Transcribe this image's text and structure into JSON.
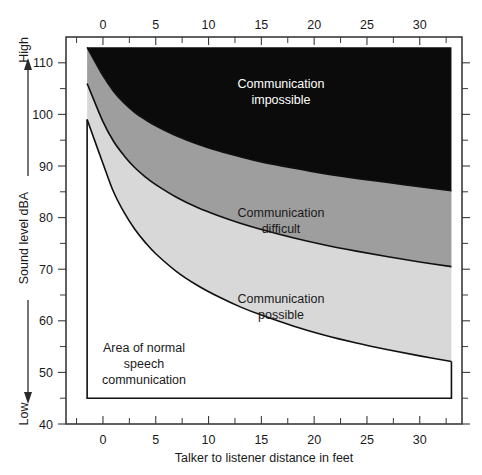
{
  "chart_data": {
    "type": "area",
    "title": "",
    "xlabel": "Talker to listener distance in feet",
    "ylabel": "Sound level dBA",
    "xlim": [
      -3.5,
      34
    ],
    "ylim": [
      40,
      115
    ],
    "grid": false,
    "legend_position": "none",
    "x_ticks_major": [
      0,
      5,
      10,
      15,
      20,
      25,
      30
    ],
    "x_tick_labels": [
      "0",
      "5",
      "10",
      "15",
      "20",
      "25",
      "30"
    ],
    "x_ticks_minor": [
      -2.5,
      2.5,
      7.5,
      12.5,
      17.5,
      22.5,
      27.5,
      32.5
    ],
    "y_ticks_major": [
      40,
      50,
      60,
      70,
      80,
      90,
      100,
      110
    ],
    "y_tick_labels": [
      "40",
      "50",
      "60",
      "70",
      "80",
      "90",
      "100",
      "110"
    ],
    "y_ticks_minor": [
      45,
      55,
      65,
      75,
      85,
      95,
      105
    ],
    "y_axis_high_label": "High",
    "y_axis_low_label": "Low",
    "x_axis_label_position": "bottom",
    "x_tick_label_positions": [
      "top",
      "bottom"
    ],
    "data_x_start": -1.5,
    "data_x_end": 33,
    "data_y_floor": 45,
    "data_y_ceiling": 113,
    "series": [
      {
        "name": "Communication impossible lower boundary",
        "description": "Upper boundary of Communication difficult band; above this line communication is impossible",
        "x": [
          -1.5,
          0,
          1,
          2,
          3,
          4,
          5,
          7,
          9,
          11,
          13,
          15,
          18,
          21,
          24,
          27,
          30,
          33
        ],
        "y": [
          113,
          107.5,
          104.5,
          102.2,
          100.4,
          99.0,
          97.8,
          95.8,
          94.2,
          92.9,
          91.8,
          90.8,
          89.6,
          88.5,
          87.6,
          86.8,
          86.0,
          85.2
        ]
      },
      {
        "name": "Communication difficult lower boundary",
        "description": "Upper boundary of Communication possible band",
        "x": [
          -1.5,
          0,
          1,
          2,
          3,
          4,
          5,
          7,
          9,
          11,
          13,
          15,
          18,
          21,
          24,
          27,
          30,
          33
        ],
        "y": [
          106.0,
          98.6,
          94.8,
          92.0,
          89.7,
          87.9,
          86.4,
          83.9,
          81.9,
          80.3,
          78.9,
          77.7,
          76.1,
          74.7,
          73.5,
          72.4,
          71.4,
          70.5
        ]
      },
      {
        "name": "Communication possible lower boundary",
        "description": "Upper boundary of Area of normal speech communication",
        "x": [
          -1.5,
          0,
          1,
          2,
          3,
          4,
          5,
          7,
          9,
          11,
          13,
          15,
          18,
          21,
          24,
          27,
          30,
          33
        ],
        "y": [
          99.0,
          90.5,
          85.0,
          81.0,
          77.8,
          75.2,
          73.0,
          69.5,
          66.8,
          64.6,
          62.7,
          61.1,
          59.0,
          57.2,
          55.7,
          54.4,
          53.2,
          52.1
        ]
      }
    ],
    "bands": [
      {
        "name": "communication-impossible",
        "label": "Communication impossible",
        "color": "#0b0b0b",
        "text_color": "#ffffff",
        "label_x": 20,
        "label_y": 103
      },
      {
        "name": "communication-difficult",
        "label": "Communication difficult",
        "color": "#9e9e9e",
        "text_color": "#1a1a1a",
        "label_x": 17.5,
        "label_y": 80.5
      },
      {
        "name": "communication-possible",
        "label": "Communication possible",
        "color": "#d8d8d8",
        "text_color": "#1a1a1a",
        "label_x": 17.5,
        "label_y": 63.5
      },
      {
        "name": "area-of-normal-speech-communication",
        "label": "Area of normal speech communication",
        "color": "#ffffff",
        "text_color": "#1a1a1a",
        "label_x": 4.5,
        "label_y": 51.5
      }
    ]
  },
  "labels": {
    "impossible_line1": "Communication",
    "impossible_line2": "impossible",
    "difficult_line1": "Communication",
    "difficult_line2": "difficult",
    "possible_line1": "Communication",
    "possible_line2": "possible",
    "normal_line1": "Area of normal",
    "normal_line2": "speech",
    "normal_line3": "communication"
  },
  "axes": {
    "x_title": "Talker to listener distance in feet",
    "y_title": "Sound level dBA",
    "y_high": "High",
    "y_low": "Low",
    "x_labels_top": [
      "0",
      "5",
      "10",
      "15",
      "20",
      "25",
      "30"
    ],
    "x_labels_bottom": [
      "0",
      "5",
      "10",
      "15",
      "20",
      "25",
      "30"
    ],
    "y_labels": [
      "110",
      "100",
      "90",
      "80",
      "70",
      "60",
      "50",
      "40"
    ]
  },
  "colors": {
    "impossible": "#0b0b0b",
    "difficult": "#9e9e9e",
    "possible": "#d8d8d8",
    "normal": "#ffffff",
    "axis": "#3a3a3a",
    "text": "#1a1a1a",
    "background": "#ffffff"
  }
}
